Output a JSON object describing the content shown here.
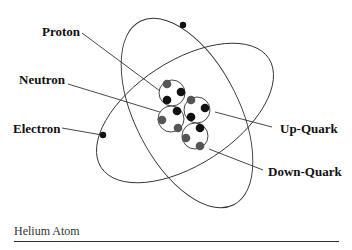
{
  "diagram": {
    "title": "Helium Atom",
    "labels": {
      "proton": "Proton",
      "neutron": "Neutron",
      "electron": "Electron",
      "up_quark": "Up-Quark",
      "down_quark": "Down-Quark"
    },
    "colors": {
      "up_quark": "#111111",
      "down_quark": "#555555",
      "line": "#333333"
    },
    "nucleons": [
      {
        "name": "proton",
        "cx": 172,
        "cy": 93,
        "quarks": [
          {
            "type": "down",
            "x": 167,
            "y": 84
          },
          {
            "type": "up",
            "x": 181,
            "y": 92
          },
          {
            "type": "up",
            "x": 167,
            "y": 100
          }
        ]
      },
      {
        "name": "neutron",
        "cx": 171,
        "cy": 119,
        "quarks": [
          {
            "type": "up",
            "x": 177,
            "y": 111
          },
          {
            "type": "down",
            "x": 162,
            "y": 120
          },
          {
            "type": "down",
            "x": 178,
            "y": 128
          }
        ]
      },
      {
        "name": "proton",
        "cx": 197,
        "cy": 110,
        "quarks": [
          {
            "type": "down",
            "x": 191,
            "y": 100
          },
          {
            "type": "up",
            "x": 205,
            "y": 108
          },
          {
            "type": "up",
            "x": 191,
            "y": 117
          }
        ]
      },
      {
        "name": "neutron",
        "cx": 195,
        "cy": 136,
        "quarks": [
          {
            "type": "up",
            "x": 200,
            "y": 128
          },
          {
            "type": "down",
            "x": 186,
            "y": 138
          },
          {
            "type": "down",
            "x": 200,
            "y": 146
          }
        ]
      }
    ]
  }
}
